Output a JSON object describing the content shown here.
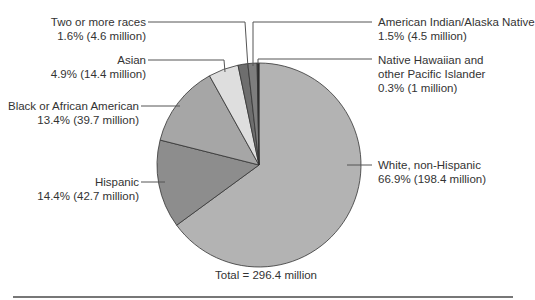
{
  "chart_data": {
    "type": "pie",
    "title": "",
    "total_label": "Total = 296.4 million",
    "total_millions": 296.4,
    "slices": [
      {
        "name": "White, non-Hispanic",
        "percent": 66.9,
        "millions": 198.4,
        "color": "#b3b3b3",
        "label_line1": "White, non-Hispanic",
        "label_line2": "66.9% (198.4 million)"
      },
      {
        "name": "Hispanic",
        "percent": 14.4,
        "millions": 42.7,
        "color": "#8d8d8d",
        "label_line1": "Hispanic",
        "label_line2": "14.4% (42.7 million)"
      },
      {
        "name": "Black or African American",
        "percent": 13.4,
        "millions": 39.7,
        "color": "#a6a6a6",
        "label_line1": "Black or African American",
        "label_line2": "13.4% (39.7 million)"
      },
      {
        "name": "Asian",
        "percent": 4.9,
        "millions": 14.4,
        "color": "#dedede",
        "label_line1": "Asian",
        "label_line2": "4.9% (14.4 million)"
      },
      {
        "name": "Two or more races",
        "percent": 1.6,
        "millions": 4.6,
        "color": "#6e6e6e",
        "label_line1": "Two or more races",
        "label_line2": "1.6% (4.6 million)"
      },
      {
        "name": "American Indian/Alaska Native",
        "percent": 1.5,
        "millions": 4.5,
        "color": "#7e7e7e",
        "label_line1": "American Indian/Alaska Native",
        "label_line2": "1.5% (4.5 million)"
      },
      {
        "name": "Native Hawaiian and other Pacific Islander",
        "percent": 0.3,
        "millions": 1,
        "color": "#2a2a2a",
        "label_line1": "Native Hawaiian and",
        "label_line1b": "other Pacific Islander",
        "label_line2": "0.3% (1 million)"
      }
    ]
  }
}
